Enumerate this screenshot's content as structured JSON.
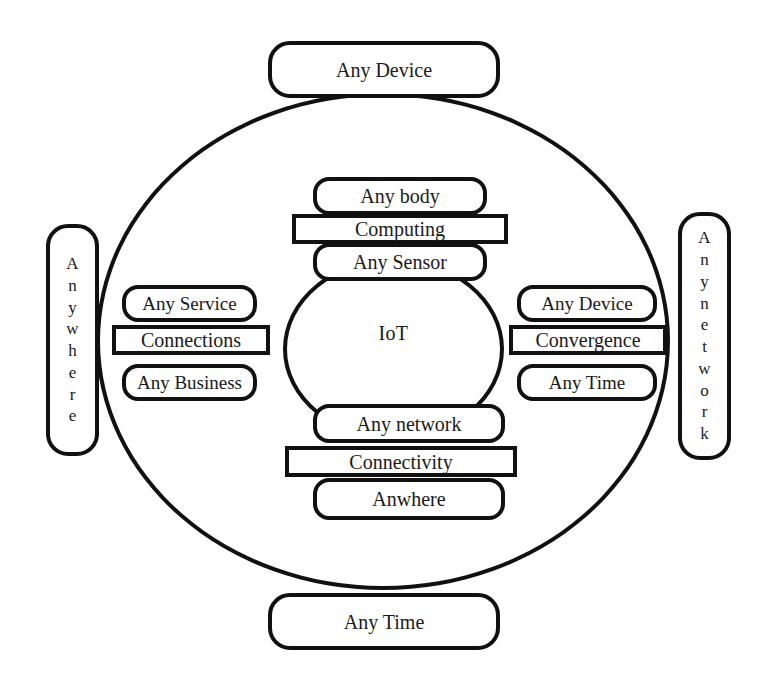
{
  "diagram": {
    "center": {
      "label": "IoT"
    },
    "outer_nodes": {
      "top": "Any Device",
      "bottom": "Any Time",
      "left_vertical": "Anywhere",
      "right_vertical": "Anynetwork"
    },
    "clusters": {
      "top": {
        "outer": "Any body",
        "connector": "Computing",
        "inner": "Any Sensor"
      },
      "left": {
        "outer": "Any Service",
        "connector": "Connections",
        "inner": "Any Business"
      },
      "right": {
        "outer": "Any Device",
        "connector": "Convergence",
        "inner": "Any Time"
      },
      "bottom": {
        "outer": "Any network",
        "connector": "Connectivity",
        "inner": "Anwhere"
      }
    },
    "colors": {
      "stroke": "#111111",
      "fill": "#ffffff",
      "text": "#1a1a1a"
    }
  }
}
